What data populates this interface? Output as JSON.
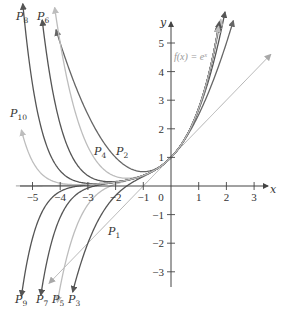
{
  "chart_data": {
    "type": "line",
    "title": "",
    "xlabel": "x",
    "ylabel": "y",
    "xlim": [
      -5.5,
      3.8
    ],
    "ylim": [
      -3.5,
      5.8
    ],
    "x_ticks": [
      -5,
      -4,
      -3,
      -2,
      -1,
      0,
      1,
      2,
      3
    ],
    "x_tick_labels": [
      "−5",
      "−4",
      "−3",
      "−2",
      "−1",
      "0",
      "1",
      "2",
      "3"
    ],
    "y_ticks": [
      -3,
      -2,
      -1,
      1,
      2,
      3,
      4,
      5
    ],
    "y_tick_labels": [
      "−3",
      "−2",
      "−1",
      "1",
      "2",
      "3",
      "4",
      "5"
    ],
    "grid": false,
    "legend": "inline labels",
    "annotation": "f(x) = eˣ",
    "series": [
      {
        "name": "f(x) = e^x",
        "kind": "exp",
        "color": "#b4b4b4",
        "xmin": -5.6,
        "xmax": 1.72
      },
      {
        "name": "P1",
        "degree": 1,
        "color": "#a8a8a8",
        "xmin": -4.4,
        "xmax": 3.6,
        "label": {
          "text": "P",
          "sub": "1",
          "x": 108,
          "y": 235
        }
      },
      {
        "name": "P2",
        "degree": 2,
        "color": "#666666",
        "xmin": -4.15,
        "xmax": 2.25,
        "label": {
          "text": "P",
          "sub": "2",
          "x": 116,
          "y": 155
        }
      },
      {
        "name": "P3",
        "degree": 3,
        "color": "#555555",
        "xmin": -3.55,
        "xmax": 1.95,
        "label": {
          "text": "P",
          "sub": "3",
          "x": 68,
          "y": 303
        }
      },
      {
        "name": "P4",
        "degree": 4,
        "color": "#bdbdbd",
        "xmin": -4.2,
        "xmax": 1.8,
        "label": {
          "text": "P",
          "sub": "4",
          "x": 94,
          "y": 155
        }
      },
      {
        "name": "P5",
        "degree": 5,
        "color": "#bdbdbd",
        "xmin": -4.1,
        "xmax": 1.75,
        "label": {
          "text": "P",
          "sub": "5",
          "x": 52,
          "y": 303
        }
      },
      {
        "name": "P6",
        "degree": 6,
        "color": "#555555",
        "xmin": -4.65,
        "xmax": 1.75,
        "label": {
          "text": "P",
          "sub": "6",
          "x": 37,
          "y": 20
        }
      },
      {
        "name": "P7",
        "degree": 7,
        "color": "#555555",
        "xmin": -4.7,
        "xmax": 1.73,
        "label": {
          "text": "P",
          "sub": "7",
          "x": 36,
          "y": 303
        }
      },
      {
        "name": "P8",
        "degree": 8,
        "color": "#555555",
        "xmin": -5.35,
        "xmax": 1.73,
        "label": {
          "text": "P",
          "sub": "8",
          "x": 16,
          "y": 20
        }
      },
      {
        "name": "P9",
        "degree": 9,
        "color": "#555555",
        "xmin": -5.4,
        "xmax": 1.72,
        "label": {
          "text": "P",
          "sub": "9",
          "x": 15,
          "y": 303
        }
      },
      {
        "name": "P10",
        "degree": 10,
        "color": "#bdbdbd",
        "xmin": -5.4,
        "xmax": 1.72,
        "label": {
          "text": "P",
          "sub": "10",
          "x": 10,
          "y": 117
        }
      }
    ]
  },
  "axes": {
    "x_label": "x",
    "y_label": "y",
    "fx_label": "f(x) = eˣ"
  }
}
